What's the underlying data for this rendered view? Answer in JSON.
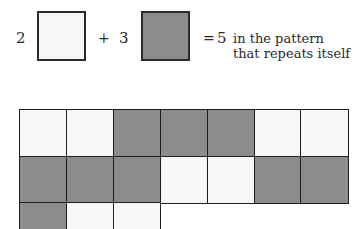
{
  "colors": {
    "white": "#f7f7f7",
    "gray": "#8c8c8c",
    "border": "#1e1e1e"
  },
  "equation": {
    "count_white": "2",
    "plus": "+",
    "count_gray": "3",
    "equals": "=",
    "total": "5",
    "caption_line1": "in the pattern",
    "caption_line2": "that repeats itself"
  },
  "pattern": {
    "unit": [
      "white",
      "white",
      "gray",
      "gray",
      "gray"
    ],
    "columns": 7,
    "visible_cells": [
      [
        "white",
        "white",
        "gray",
        "gray",
        "gray",
        "white",
        "white"
      ],
      [
        "gray",
        "gray",
        "gray",
        "white",
        "white",
        "gray",
        "gray"
      ],
      [
        "gray",
        "white",
        "white"
      ]
    ]
  }
}
